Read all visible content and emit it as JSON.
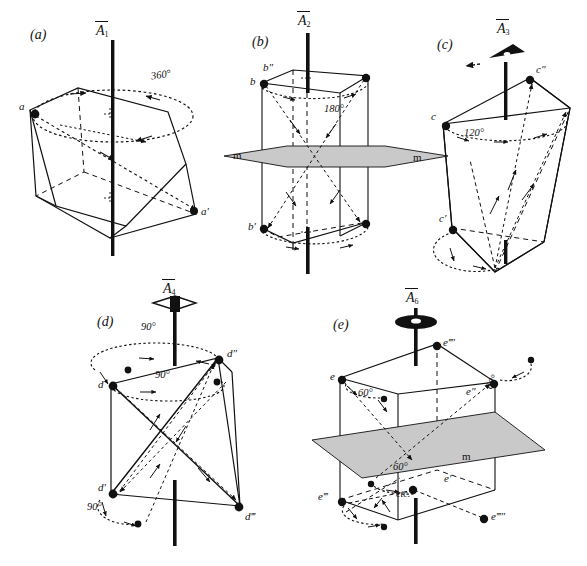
{
  "figure": {
    "background": "#ffffff",
    "ink": "#111111",
    "plane_fill": "#c9c9c9",
    "width": 587,
    "height": 566
  },
  "panels": [
    {
      "id": "(a)",
      "axis_label": "A",
      "axis_order": "1",
      "axis_symbol": "bar-1-axis",
      "rotation_angle": "360°",
      "points": [
        "a",
        "a′"
      ],
      "mirror_labels": [],
      "notes": []
    },
    {
      "id": "(b)",
      "axis_label": "A",
      "axis_order": "2",
      "axis_symbol": "bar-2-axis",
      "rotation_angle": "180°",
      "points": [
        "b",
        "b′",
        "b″"
      ],
      "mirror_labels": [
        "m",
        "m"
      ],
      "notes": []
    },
    {
      "id": "(c)",
      "axis_label": "A",
      "axis_order": "3",
      "axis_symbol": "bar-3-axis-triangle",
      "rotation_angle": "120°",
      "points": [
        "c",
        "c′",
        "c″"
      ],
      "mirror_labels": [],
      "notes": []
    },
    {
      "id": "(d)",
      "axis_label": "A",
      "axis_order": "4",
      "axis_symbol": "bar-4-axis-lens",
      "rotation_angle": "90°",
      "angles_shown": [
        "90°",
        "90°",
        "90°"
      ],
      "points": [
        "d",
        "d′",
        "d″",
        "d‴"
      ],
      "mirror_labels": [],
      "notes": []
    },
    {
      "id": "(e)",
      "axis_label": "A",
      "axis_order": "6",
      "axis_symbol": "bar-6-axis-hexlens",
      "rotation_angle": "60°",
      "angles_shown": [
        "60°",
        "60°",
        "60°"
      ],
      "points": [
        "e",
        "e′",
        "e″",
        "e‴",
        "e‴′",
        "e‴″"
      ],
      "mirror_labels": [
        "m"
      ],
      "notes": [
        "etc."
      ]
    }
  ],
  "labels": {
    "panel_a_id": "(a)",
    "panel_b_id": "(b)",
    "panel_c_id": "(c)",
    "panel_d_id": "(d)",
    "panel_e_id": "(e)",
    "a_pt": "a",
    "a_prime": "a′",
    "a_angle": "360°",
    "b_pt": "b",
    "b_dprime": "b″",
    "b_prime": "b′",
    "b_angle": "180°",
    "b_m_left": "m",
    "b_m_right": "m",
    "c_pt": "c",
    "c_dprime": "c″",
    "c_prime": "c′",
    "c_angle": "120°",
    "d_pt": "d",
    "d_prime": "d′",
    "d_dprime": "d″",
    "d_tprime": "d‴",
    "d_angle_1": "90°",
    "d_angle_2": "90°",
    "d_angle_3": "90°",
    "e_pt": "e",
    "e_prime": "e′",
    "e_dprime": "e″",
    "e_tprime": "e‴",
    "e_qprime": "e‴′",
    "e_pprime": "e‴″",
    "e_angle_1": "60°",
    "e_angle_2": "60°",
    "e_angle_3": "60°",
    "e_m": "m",
    "e_etc": "etc.",
    "axis_a": "A",
    "axis_b": "A",
    "axis_c": "A",
    "axis_d": "A",
    "axis_e": "A",
    "sub_a": "1",
    "sub_b": "2",
    "sub_c": "3",
    "sub_d": "4",
    "sub_e": "6"
  }
}
